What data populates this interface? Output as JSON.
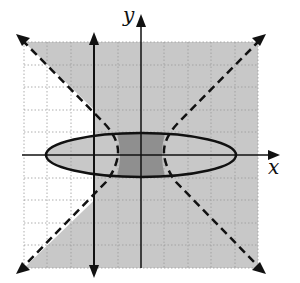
{
  "graph": {
    "title": "",
    "x_axis_label": "x",
    "y_axis_label": "y",
    "grid": {
      "x_min": -5,
      "x_max": 5,
      "y_min": -5,
      "y_max": 5,
      "cells": 10
    },
    "curves": [
      {
        "name": "ellipse",
        "style": "solid",
        "center": [
          0,
          0
        ],
        "rx": 4.2,
        "ry": 1
      },
      {
        "name": "hyperbola",
        "style": "dashed",
        "orientation": "vertical-opening asymptotes y=±x"
      },
      {
        "name": "vertical-line",
        "style": "solid",
        "equation": "x = -2"
      }
    ],
    "colors": {
      "shade_light": "#c8c8c8",
      "shade_dark": "#8f8f8f",
      "grid": "#9a9a9a",
      "line": "#111111"
    }
  }
}
